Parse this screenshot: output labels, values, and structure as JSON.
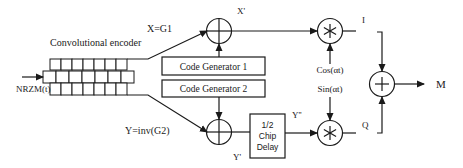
{
  "diagram": {
    "type": "block-diagram",
    "title": "",
    "encoder": {
      "label": "Convolutional encoder",
      "input_label": "NRZM(t)",
      "register_cells_per_row": 7
    },
    "signals": {
      "x": "X=G1",
      "x_prime": "X'",
      "y": "Y=inv(G2)",
      "y_prime": "Y'",
      "y_double_prime": "Y''",
      "i": "I",
      "q": "Q",
      "m": "M",
      "cos": "Cos(αt)",
      "sin": "Sin(αt)"
    },
    "blocks": {
      "code_gen_1": "Code Generator 1",
      "code_gen_2": "Code Generator 2",
      "delay_line1": "1/2",
      "delay_line2": "Chip",
      "delay_line3": "Delay"
    },
    "operators": {
      "xor_symbol": "⊕",
      "multiply_symbol": "∗",
      "sum_symbol": "+"
    },
    "colors": {
      "line": "#1a1a1a",
      "background": "#ffffff"
    }
  }
}
